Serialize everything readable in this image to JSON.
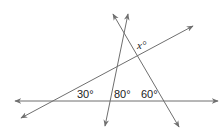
{
  "diagram": {
    "type": "geometry-intersecting-lines",
    "lines": [
      {
        "name": "horizontal-line",
        "arrows": "both"
      },
      {
        "name": "rising-line",
        "arrows": "both"
      },
      {
        "name": "steep-line-left",
        "arrows": "both"
      },
      {
        "name": "steep-line-right",
        "arrows": "both"
      }
    ],
    "angles": {
      "angle_30": "30°",
      "angle_80": "80°",
      "angle_60": "60°",
      "angle_x": "x°"
    },
    "colors": {
      "line": "#6f6f6f",
      "text": "#222222"
    }
  }
}
